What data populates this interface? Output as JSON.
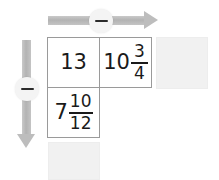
{
  "canvas": {
    "width": 219,
    "height": 180,
    "background": "#ffffff"
  },
  "controls": {
    "horizontal_slider": {
      "name": "horizontal-arrow",
      "direction": "right",
      "handle_label": "−",
      "handle_icon": "minus-icon",
      "color": "#bdbdbd"
    },
    "vertical_slider": {
      "name": "vertical-arrow",
      "direction": "down",
      "handle_label": "−",
      "handle_icon": "minus-icon",
      "color": "#bdbdbd"
    }
  },
  "grid": {
    "rows": [
      {
        "cells": [
          {
            "id": "cell-r0c0",
            "type": "whole",
            "text": "13",
            "whole": "13",
            "numerator": "",
            "denominator": ""
          },
          {
            "id": "cell-r0c1",
            "type": "mixed",
            "text": "10 3/4",
            "whole": "10",
            "numerator": "3",
            "denominator": "4"
          }
        ]
      },
      {
        "cells": [
          {
            "id": "cell-r1c0",
            "type": "mixed",
            "text": "7 10/12",
            "whole": "7",
            "numerator": "10",
            "denominator": "12"
          },
          {
            "id": "cell-r1c1",
            "type": "empty",
            "text": "",
            "whole": "",
            "numerator": "",
            "denominator": ""
          }
        ]
      }
    ],
    "border_color": "#9a9a9a",
    "cell_background": "#ffffff"
  },
  "ghost_cells": [
    {
      "id": "ghost-right",
      "position": "right",
      "color": "#f1f1f1"
    },
    {
      "id": "ghost-bottom",
      "position": "bottom",
      "color": "#f1f1f1"
    }
  ]
}
